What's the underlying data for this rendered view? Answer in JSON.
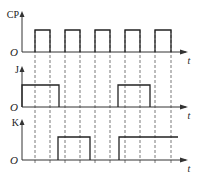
{
  "diagram": {
    "type": "timing-diagram",
    "colors": {
      "line": "#222222",
      "dash": "#555555",
      "axis": "#333333"
    },
    "origin_label": "O",
    "time_label": "t",
    "clock_edges_x": [
      35,
      50,
      65,
      80,
      95,
      110,
      125,
      140,
      155,
      171
    ],
    "signals": [
      {
        "name": "CP",
        "label": "CP",
        "axis_y": 52,
        "high_y": 30,
        "top_y": 12,
        "pulses": [
          [
            35,
            50
          ],
          [
            65,
            80
          ],
          [
            95,
            110
          ],
          [
            125,
            140
          ],
          [
            155,
            171
          ]
        ],
        "open_end": false
      },
      {
        "name": "J",
        "label": "J",
        "axis_y": 107,
        "high_y": 85,
        "top_y": 67,
        "pulses": [
          [
            22,
            59
          ],
          [
            118,
            150
          ]
        ],
        "open_end": false
      },
      {
        "name": "K",
        "label": "K",
        "axis_y": 160,
        "high_y": 137,
        "top_y": 120,
        "pulses": [
          [
            58,
            90
          ],
          [
            119,
            178
          ]
        ],
        "open_end": true
      }
    ]
  }
}
